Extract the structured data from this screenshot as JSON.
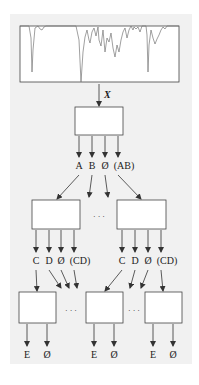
{
  "colors": {
    "panel_bg": "#f1f1f1",
    "line": "#333333",
    "box_fill": "#ffffff",
    "spectrum": "#777777"
  },
  "spectrum": {
    "input_label": "X"
  },
  "level1": {
    "outputs": [
      "A",
      "B",
      "Ø",
      "(AB)"
    ]
  },
  "level2": {
    "ellipsis": "· · ·",
    "left_outputs": [
      "C",
      "D",
      "Ø",
      "(CD)"
    ],
    "right_outputs": [
      "C",
      "D",
      "Ø",
      "(CD)"
    ]
  },
  "level3": {
    "ellipsis": "· · ·",
    "boxes": [
      {
        "outputs": [
          "E",
          "Ø"
        ]
      },
      {
        "outputs": [
          "E",
          "Ø"
        ]
      },
      {
        "outputs": [
          "E",
          "Ø"
        ]
      }
    ]
  }
}
